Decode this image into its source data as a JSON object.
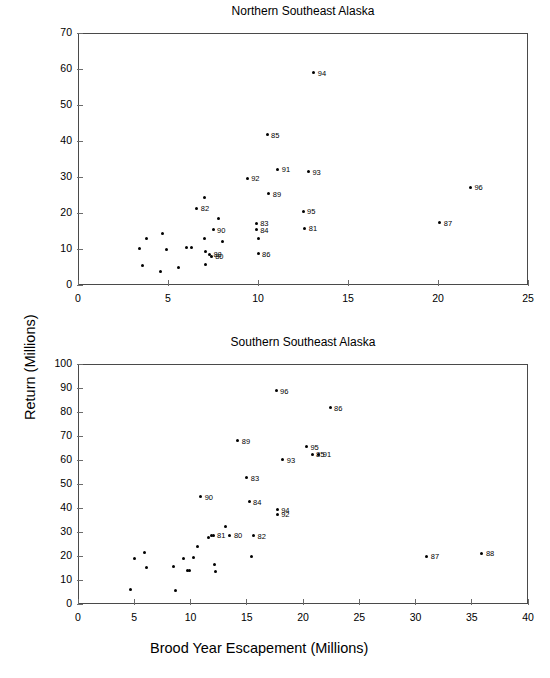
{
  "figure": {
    "xlabel": "Brood Year Escapement (Millions)",
    "ylabel": "Return (Millions)",
    "ink_color": "#000000",
    "axis_color": "#6b6b6b",
    "background": "#ffffff"
  },
  "chart_data": [
    {
      "type": "scatter",
      "title": "Northern Southeast Alaska",
      "xlabel": "",
      "ylabel": "Return (Millions)",
      "xlim": [
        0,
        25
      ],
      "ylim": [
        0,
        70
      ],
      "xticks": [
        0,
        5,
        10,
        15,
        20,
        25
      ],
      "yticks": [
        0,
        10,
        20,
        30,
        40,
        50,
        60,
        70
      ],
      "grid": false,
      "legend": "none",
      "marker": "filled-circle",
      "points": [
        {
          "x": 3.4,
          "y": 10.2,
          "label": ""
        },
        {
          "x": 3.6,
          "y": 5.5,
          "label": ""
        },
        {
          "x": 3.8,
          "y": 13.0,
          "label": ""
        },
        {
          "x": 4.6,
          "y": 3.8,
          "label": ""
        },
        {
          "x": 4.7,
          "y": 14.4,
          "label": ""
        },
        {
          "x": 4.9,
          "y": 9.8,
          "label": ""
        },
        {
          "x": 5.6,
          "y": 4.8,
          "label": ""
        },
        {
          "x": 6.0,
          "y": 10.5,
          "label": ""
        },
        {
          "x": 6.3,
          "y": 10.5,
          "label": ""
        },
        {
          "x": 6.6,
          "y": 21.3,
          "label": "82"
        },
        {
          "x": 7.0,
          "y": 24.4,
          "label": ""
        },
        {
          "x": 7.0,
          "y": 12.8,
          "label": ""
        },
        {
          "x": 7.1,
          "y": 9.4,
          "label": ""
        },
        {
          "x": 7.1,
          "y": 5.7,
          "label": ""
        },
        {
          "x": 7.3,
          "y": 8.6,
          "label": "88"
        },
        {
          "x": 7.4,
          "y": 8.0,
          "label": "80"
        },
        {
          "x": 7.5,
          "y": 15.4,
          "label": "90"
        },
        {
          "x": 7.8,
          "y": 18.4,
          "label": ""
        },
        {
          "x": 8.0,
          "y": 12.0,
          "label": ""
        },
        {
          "x": 9.4,
          "y": 29.6,
          "label": "92"
        },
        {
          "x": 9.9,
          "y": 17.1,
          "label": "83"
        },
        {
          "x": 9.9,
          "y": 15.3,
          "label": "84"
        },
        {
          "x": 10.0,
          "y": 12.8,
          "label": ""
        },
        {
          "x": 10.0,
          "y": 8.7,
          "label": "86"
        },
        {
          "x": 10.5,
          "y": 41.8,
          "label": "85"
        },
        {
          "x": 10.6,
          "y": 25.3,
          "label": "89"
        },
        {
          "x": 11.1,
          "y": 32.1,
          "label": "91"
        },
        {
          "x": 12.5,
          "y": 20.5,
          "label": "95"
        },
        {
          "x": 12.6,
          "y": 15.7,
          "label": "81"
        },
        {
          "x": 12.8,
          "y": 31.4,
          "label": "93"
        },
        {
          "x": 13.1,
          "y": 58.9,
          "label": "94"
        },
        {
          "x": 20.1,
          "y": 17.3,
          "label": "87"
        },
        {
          "x": 21.8,
          "y": 27.2,
          "label": "96"
        }
      ]
    },
    {
      "type": "scatter",
      "title": "Southern Southeast Alaska",
      "xlabel": "Brood Year Escapement (Millions)",
      "ylabel": "Return (Millions)",
      "xlim": [
        0,
        40
      ],
      "ylim": [
        0,
        100
      ],
      "xticks": [
        0,
        5,
        10,
        15,
        20,
        25,
        30,
        35,
        40
      ],
      "yticks": [
        0,
        10,
        20,
        30,
        40,
        50,
        60,
        70,
        80,
        90,
        100
      ],
      "grid": false,
      "legend": "none",
      "marker": "filled-circle",
      "points": [
        {
          "x": 4.7,
          "y": 6.2,
          "label": ""
        },
        {
          "x": 5.0,
          "y": 18.8,
          "label": ""
        },
        {
          "x": 5.9,
          "y": 21.6,
          "label": ""
        },
        {
          "x": 6.1,
          "y": 15.1,
          "label": ""
        },
        {
          "x": 8.5,
          "y": 15.5,
          "label": ""
        },
        {
          "x": 8.7,
          "y": 5.6,
          "label": ""
        },
        {
          "x": 9.4,
          "y": 18.8,
          "label": ""
        },
        {
          "x": 9.7,
          "y": 14.0,
          "label": ""
        },
        {
          "x": 9.9,
          "y": 13.8,
          "label": ""
        },
        {
          "x": 10.3,
          "y": 19.5,
          "label": ""
        },
        {
          "x": 10.6,
          "y": 24.0,
          "label": ""
        },
        {
          "x": 10.9,
          "y": 44.7,
          "label": "90"
        },
        {
          "x": 11.6,
          "y": 27.7,
          "label": ""
        },
        {
          "x": 11.9,
          "y": 28.7,
          "label": ""
        },
        {
          "x": 12.0,
          "y": 28.7,
          "label": "81"
        },
        {
          "x": 12.1,
          "y": 16.3,
          "label": ""
        },
        {
          "x": 12.2,
          "y": 13.6,
          "label": ""
        },
        {
          "x": 13.1,
          "y": 32.4,
          "label": ""
        },
        {
          "x": 13.5,
          "y": 28.6,
          "label": "80"
        },
        {
          "x": 14.2,
          "y": 68.0,
          "label": "89"
        },
        {
          "x": 15.0,
          "y": 52.6,
          "label": "83"
        },
        {
          "x": 15.2,
          "y": 42.6,
          "label": "84"
        },
        {
          "x": 15.4,
          "y": 19.6,
          "label": ""
        },
        {
          "x": 15.6,
          "y": 28.5,
          "label": "82"
        },
        {
          "x": 17.6,
          "y": 88.8,
          "label": "96"
        },
        {
          "x": 17.7,
          "y": 39.3,
          "label": "94"
        },
        {
          "x": 17.7,
          "y": 37.3,
          "label": "92"
        },
        {
          "x": 18.2,
          "y": 60.1,
          "label": "93"
        },
        {
          "x": 20.3,
          "y": 65.5,
          "label": "95"
        },
        {
          "x": 20.8,
          "y": 62.3,
          "label": "85"
        },
        {
          "x": 21.4,
          "y": 62.3,
          "label": "91"
        },
        {
          "x": 22.4,
          "y": 81.8,
          "label": "86"
        },
        {
          "x": 31.0,
          "y": 19.8,
          "label": "87"
        },
        {
          "x": 35.9,
          "y": 21.2,
          "label": "88"
        }
      ]
    }
  ]
}
